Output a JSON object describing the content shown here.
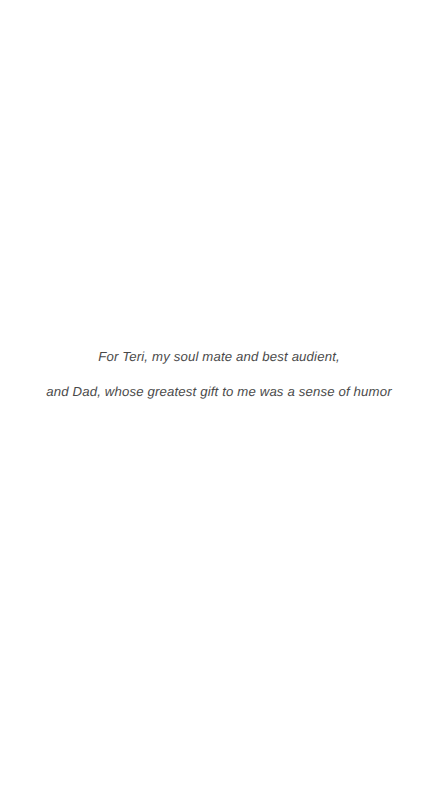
{
  "page": {
    "type": "book-dedication-page",
    "background_color": "#ffffff",
    "text_color": "#3a3a3a"
  },
  "dedication": {
    "lines": [
      "For Teri, my soul mate and best audient,",
      "and Dad, whose greatest gift to me was a sense of humor"
    ]
  }
}
